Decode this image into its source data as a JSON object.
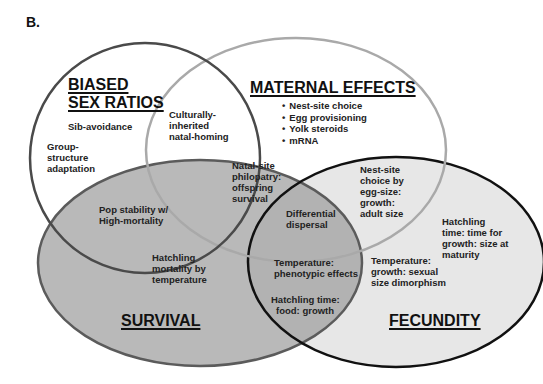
{
  "panel_label": "B.",
  "sets": {
    "biased_sex_ratios": {
      "title_line1": "BIASED",
      "title_line2": "SEX RATIOS",
      "fill": "#ffffff",
      "stroke": "#4a4a4a",
      "items": [
        "Sib-avoidance",
        "Group-",
        "structure",
        "adaptation"
      ]
    },
    "maternal_effects": {
      "title": "MATERNAL EFFECTS",
      "fill": "none",
      "stroke": "#a8a8a8",
      "bullets": [
        "Nest-site choice",
        "Egg provisioning",
        "Yolk steroids",
        "mRNA"
      ]
    },
    "survival": {
      "title": "SURVIVAL",
      "fill": "#b8b8b8",
      "stroke": "#5a5a5a",
      "items": [
        "Hatchling",
        "mortality by",
        "temperature"
      ]
    },
    "fecundity": {
      "title": "FECUNDITY",
      "fill": "#e6e6e6",
      "stroke": "#111111",
      "items": [
        "Hatchling",
        "time: time for",
        "growth: size at",
        "maturity"
      ]
    }
  },
  "intersections": {
    "biased_maternal": [
      "Culturally-",
      "inherited",
      "natal-homing"
    ],
    "biased_survival": [
      "Pop stability w/",
      "High-mortality"
    ],
    "maternal_survival": [
      "Natal-site",
      "philopatry:",
      "offspring",
      "survival"
    ],
    "maternal_survival_fecundity": [
      "Differential",
      "dispersal"
    ],
    "maternal_fecundity": [
      "Nest-site",
      "choice by",
      "egg-size:",
      "growth:",
      "adult size"
    ],
    "survival_fecundity": [
      "Temperature:",
      "phenotypic effects",
      "Hatchling time:",
      "food: growth"
    ],
    "fecundity_only_lower": [
      "Temperature:",
      "growth: sexual",
      "size dimorphism"
    ]
  }
}
